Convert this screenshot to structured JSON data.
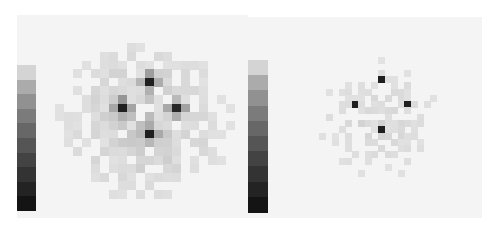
{
  "chart_data": [
    {
      "type": "heatmap",
      "title": "",
      "xlabel": "",
      "ylabel": "",
      "colormap": "grayscale (light = low, dark = high)",
      "grid": false,
      "legend": "vertical colorbar on left, white (top) to black (bottom)",
      "grid_size": [
        22,
        22
      ],
      "background_level": 0.06,
      "noise_amplitude": 0.22,
      "noise_radius": 10,
      "seed": 7,
      "peaks": [
        {
          "row": 6,
          "col": 11,
          "value": 0.95,
          "label": "top spot"
        },
        {
          "row": 9,
          "col": 8,
          "value": 0.95,
          "label": "left spot"
        },
        {
          "row": 9,
          "col": 14,
          "value": 0.92,
          "label": "right spot"
        },
        {
          "row": 12,
          "col": 11,
          "value": 0.95,
          "label": "bottom spot"
        }
      ],
      "halo": 0.45
    },
    {
      "type": "heatmap",
      "title": "",
      "xlabel": "",
      "ylabel": "",
      "colormap": "grayscale (light = low, dark = high)",
      "grid": false,
      "legend": "vertical colorbar on left, white (top) to black (bottom)",
      "grid_size": [
        30,
        30
      ],
      "background_level": 0.04,
      "noise_amplitude": 0.14,
      "noise_radius": 13,
      "seed": 23,
      "peaks": [
        {
          "row": 8,
          "col": 15,
          "value": 0.95,
          "label": "top spot"
        },
        {
          "row": 12,
          "col": 11,
          "value": 0.95,
          "label": "left spot"
        },
        {
          "row": 12,
          "col": 19,
          "value": 0.95,
          "label": "right spot"
        },
        {
          "row": 16,
          "col": 15,
          "value": 0.95,
          "label": "bottom spot"
        }
      ],
      "halo": 0.12
    }
  ],
  "layout": {
    "panels": [
      {
        "x": 17,
        "y": 15,
        "w": 231,
        "h": 203,
        "colorbar": {
          "x": 17,
          "y": 65,
          "w": 19,
          "h": 146
        },
        "heatmap": {
          "x": 46,
          "y": 26,
          "w": 198,
          "h": 190
        }
      },
      {
        "x": 248,
        "y": 17,
        "w": 234,
        "h": 201,
        "colorbar": {
          "x": 248,
          "y": 60,
          "w": 20,
          "h": 152
        },
        "heatmap": {
          "x": 280,
          "y": 26,
          "w": 196,
          "h": 188
        }
      }
    ]
  }
}
